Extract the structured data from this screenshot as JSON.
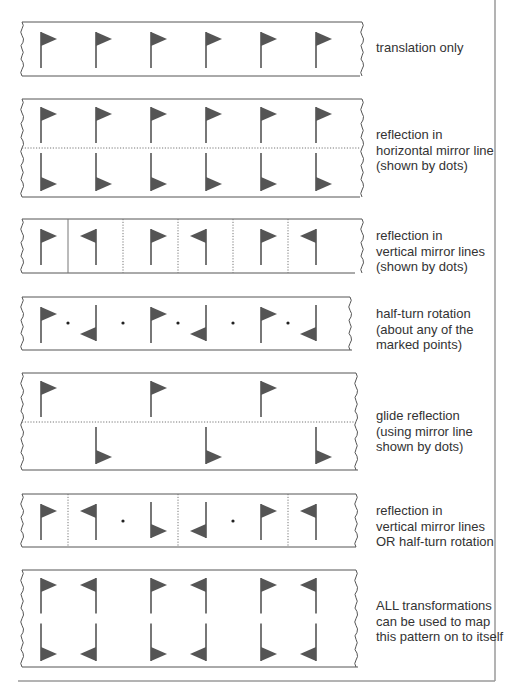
{
  "colors": {
    "flag": "#555555",
    "stroke": "#555555",
    "border": "#9a9a9a",
    "text": "#333333"
  },
  "strips": [
    {
      "id": "translation",
      "top": 22,
      "bottom": 76,
      "right_top": 362,
      "right_bottom": 360,
      "caption_top": 40,
      "caption": [
        "translation only"
      ],
      "h_mirror": null,
      "v_mirrors": [],
      "points": [],
      "flags": [
        {
          "x": 41,
          "dir": "right",
          "pos": "up"
        },
        {
          "x": 96,
          "dir": "right",
          "pos": "up"
        },
        {
          "x": 151,
          "dir": "right",
          "pos": "up"
        },
        {
          "x": 206,
          "dir": "right",
          "pos": "up"
        },
        {
          "x": 261,
          "dir": "right",
          "pos": "up"
        },
        {
          "x": 316,
          "dir": "right",
          "pos": "up"
        }
      ]
    },
    {
      "id": "horizontal-reflection",
      "top": 99,
      "bottom": 197,
      "right_top": 362,
      "right_bottom": 360,
      "caption_top": 127,
      "caption": [
        "reflection in",
        "horizontal mirror line",
        "(shown by dots)"
      ],
      "h_mirror": 148,
      "v_mirrors": [],
      "points": [],
      "flags": [
        {
          "x": 41,
          "dir": "right",
          "pos": "top"
        },
        {
          "x": 96,
          "dir": "right",
          "pos": "top"
        },
        {
          "x": 151,
          "dir": "right",
          "pos": "top"
        },
        {
          "x": 206,
          "dir": "right",
          "pos": "top"
        },
        {
          "x": 261,
          "dir": "right",
          "pos": "top"
        },
        {
          "x": 316,
          "dir": "right",
          "pos": "top"
        },
        {
          "x": 41,
          "dir": "right",
          "pos": "bottom"
        },
        {
          "x": 96,
          "dir": "right",
          "pos": "bottom"
        },
        {
          "x": 151,
          "dir": "right",
          "pos": "bottom"
        },
        {
          "x": 206,
          "dir": "right",
          "pos": "bottom"
        },
        {
          "x": 261,
          "dir": "right",
          "pos": "bottom"
        },
        {
          "x": 316,
          "dir": "right",
          "pos": "bottom"
        }
      ]
    },
    {
      "id": "vertical-reflection",
      "top": 219,
      "bottom": 273,
      "right_top": 362,
      "right_bottom": 355,
      "caption_top": 228,
      "caption": [
        "reflection in",
        "vertical mirror lines",
        "(shown by dots)"
      ],
      "h_mirror": null,
      "v_mirrors": [
        68,
        123,
        178,
        233,
        288
      ],
      "points": [],
      "solid_v": [
        68
      ],
      "flags": [
        {
          "x": 41,
          "dir": "right",
          "pos": "up"
        },
        {
          "x": 96,
          "dir": "left",
          "pos": "up"
        },
        {
          "x": 151,
          "dir": "right",
          "pos": "up"
        },
        {
          "x": 206,
          "dir": "left",
          "pos": "up"
        },
        {
          "x": 261,
          "dir": "right",
          "pos": "up"
        },
        {
          "x": 316,
          "dir": "left",
          "pos": "up"
        }
      ]
    },
    {
      "id": "half-turn",
      "top": 297,
      "bottom": 350,
      "right_top": 350,
      "right_bottom": 352,
      "caption_top": 306,
      "caption": [
        "half-turn rotation",
        "(about any of the",
        "marked points)"
      ],
      "h_mirror": null,
      "v_mirrors": [],
      "points": [
        68,
        123,
        178,
        233,
        288
      ],
      "point_y": 323,
      "flags": [
        {
          "x": 41,
          "dir": "right",
          "pos": "up"
        },
        {
          "x": 96,
          "dir": "left",
          "pos": "down"
        },
        {
          "x": 151,
          "dir": "right",
          "pos": "up"
        },
        {
          "x": 206,
          "dir": "left",
          "pos": "down"
        },
        {
          "x": 261,
          "dir": "right",
          "pos": "up"
        },
        {
          "x": 316,
          "dir": "left",
          "pos": "down"
        }
      ]
    },
    {
      "id": "glide-reflection",
      "top": 373,
      "bottom": 470,
      "right_top": 356,
      "right_bottom": 358,
      "caption_top": 408,
      "caption": [
        "glide reflection",
        "(using mirror line",
        "shown by dots)"
      ],
      "h_mirror": 422,
      "v_mirrors": [],
      "points": [],
      "flags": [
        {
          "x": 41,
          "dir": "right",
          "pos": "top"
        },
        {
          "x": 151,
          "dir": "right",
          "pos": "top"
        },
        {
          "x": 261,
          "dir": "right",
          "pos": "top"
        },
        {
          "x": 96,
          "dir": "right",
          "pos": "bottom"
        },
        {
          "x": 206,
          "dir": "right",
          "pos": "bottom"
        },
        {
          "x": 316,
          "dir": "right",
          "pos": "bottom"
        }
      ]
    },
    {
      "id": "vertical-reflection-or-half-turn",
      "top": 494,
      "bottom": 547,
      "right_top": 356,
      "right_bottom": 356,
      "caption_top": 503,
      "caption": [
        "reflection in",
        "vertical mirror lines",
        "OR half-turn rotation"
      ],
      "h_mirror": null,
      "v_mirrors": [
        68,
        178,
        288
      ],
      "points": [
        123,
        233
      ],
      "point_y": 521,
      "flags": [
        {
          "x": 41,
          "dir": "right",
          "pos": "up"
        },
        {
          "x": 96,
          "dir": "left",
          "pos": "up"
        },
        {
          "x": 151,
          "dir": "right",
          "pos": "down"
        },
        {
          "x": 206,
          "dir": "left",
          "pos": "down"
        },
        {
          "x": 261,
          "dir": "right",
          "pos": "up"
        },
        {
          "x": 316,
          "dir": "left",
          "pos": "up"
        }
      ]
    },
    {
      "id": "all-transformations",
      "top": 570,
      "bottom": 667,
      "right_top": 356,
      "right_bottom": 358,
      "caption_top": 598,
      "caption": [
        "ALL transformations",
        "can be used to map",
        "this pattern on to itself"
      ],
      "h_mirror": null,
      "v_mirrors": [],
      "points": [],
      "flags": [
        {
          "x": 41,
          "dir": "right",
          "pos": "top"
        },
        {
          "x": 96,
          "dir": "left",
          "pos": "top"
        },
        {
          "x": 151,
          "dir": "right",
          "pos": "top"
        },
        {
          "x": 206,
          "dir": "left",
          "pos": "top"
        },
        {
          "x": 261,
          "dir": "right",
          "pos": "top"
        },
        {
          "x": 316,
          "dir": "left",
          "pos": "top"
        },
        {
          "x": 41,
          "dir": "right",
          "pos": "bottom"
        },
        {
          "x": 96,
          "dir": "left",
          "pos": "bottom"
        },
        {
          "x": 151,
          "dir": "right",
          "pos": "bottom"
        },
        {
          "x": 206,
          "dir": "left",
          "pos": "bottom"
        },
        {
          "x": 261,
          "dir": "right",
          "pos": "bottom"
        },
        {
          "x": 316,
          "dir": "left",
          "pos": "bottom"
        }
      ]
    }
  ],
  "captions": {
    "s0": [
      "translation only"
    ],
    "s1": [
      "reflection in",
      "horizontal mirror line",
      "(shown by dots)"
    ],
    "s2": [
      "reflection in",
      "vertical mirror lines",
      "(shown by dots)"
    ],
    "s3": [
      "half-turn rotation",
      "(about any of the",
      "marked points)"
    ],
    "s4": [
      "glide reflection",
      "(using mirror line",
      "shown by dots)"
    ],
    "s5": [
      "reflection in",
      "vertical mirror lines",
      "OR half-turn rotation"
    ],
    "s6": [
      "ALL transformations",
      "can be used to map",
      "this pattern on to itself"
    ]
  }
}
